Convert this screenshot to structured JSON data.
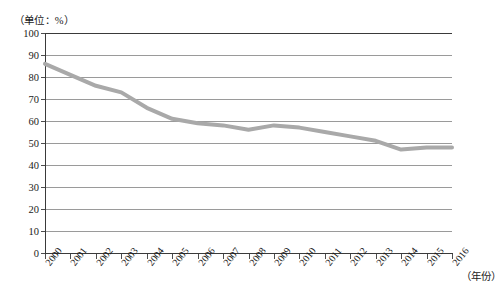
{
  "chart_data": {
    "type": "line",
    "title": "",
    "unit_note": "（单位：%）",
    "xlabel": "（年份）",
    "ylabel": "",
    "grid": true,
    "legend": "none",
    "xlim": [
      2000,
      2016
    ],
    "ylim": [
      0,
      100
    ],
    "ytick_step": 10,
    "yticks": [
      100,
      90,
      80,
      70,
      60,
      50,
      40,
      30,
      20,
      10,
      0
    ],
    "categories": [
      "2000",
      "2001",
      "2002",
      "2003",
      "2004",
      "2005",
      "2006",
      "2007",
      "2008",
      "2009",
      "2010",
      "2011",
      "2012",
      "2013",
      "2014",
      "2015",
      "2016"
    ],
    "series": [
      {
        "name": "比例",
        "color": "#a9a9a9",
        "values": [
          86,
          81,
          76,
          73,
          66,
          61,
          59,
          58,
          56,
          58,
          57,
          55,
          53,
          51,
          47,
          48,
          48
        ]
      }
    ]
  },
  "style": {
    "line_color": "#a9a9a9",
    "grid_color": "#9a9a9a",
    "axis_color": "#3a3a3a",
    "text_color": "#1a1a1a",
    "background": "#ffffff"
  }
}
